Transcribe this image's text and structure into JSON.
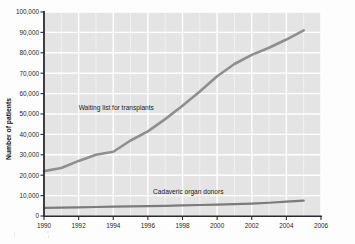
{
  "chart_data": {
    "type": "line",
    "title": "",
    "xlabel": "",
    "ylabel": "Number of patients",
    "xlim": [
      1990,
      2006
    ],
    "ylim": [
      0,
      100000
    ],
    "grid": true,
    "legend_position": "inline-annotation",
    "xticks": [
      "1990",
      "1992",
      "1994",
      "1996",
      "1998",
      "2000",
      "2002",
      "2004",
      "2006"
    ],
    "yticks": [
      "0",
      "10,000",
      "20,000",
      "30,000",
      "40,000",
      "50,000",
      "60,000",
      "70,000",
      "80,000",
      "90,000",
      "100,000"
    ],
    "x": [
      1990,
      1991,
      1992,
      1993,
      1994,
      1995,
      1996,
      1997,
      1998,
      1999,
      2000,
      2001,
      2002,
      2003,
      2004,
      2005
    ],
    "series": [
      {
        "name": "Waiting list for transplants",
        "color": "#8f8f8f",
        "values": [
          22000,
          23500,
          27000,
          30000,
          31500,
          37000,
          41500,
          47500,
          54000,
          61000,
          68500,
          74500,
          79000,
          82500,
          86500,
          91000
        ]
      },
      {
        "name": "Cadaveric organ donors",
        "color": "#7b7b7b",
        "values": [
          4000,
          4100,
          4250,
          4400,
          4550,
          4700,
          4850,
          5000,
          5200,
          5400,
          5600,
          5800,
          6100,
          6500,
          7000,
          7500
        ]
      }
    ],
    "annotations": [
      {
        "text": "Waiting list for transplants",
        "x": 1992.0,
        "y": 52000
      },
      {
        "text": "Cadaveric organ donors",
        "x": 1996.3,
        "y": 11000
      }
    ]
  },
  "style": {
    "plot_background": "#e4e4e4",
    "gridline_color": "#ffffff",
    "axis_color": "#2b2b2b",
    "page_background": "#fdfdfd"
  }
}
